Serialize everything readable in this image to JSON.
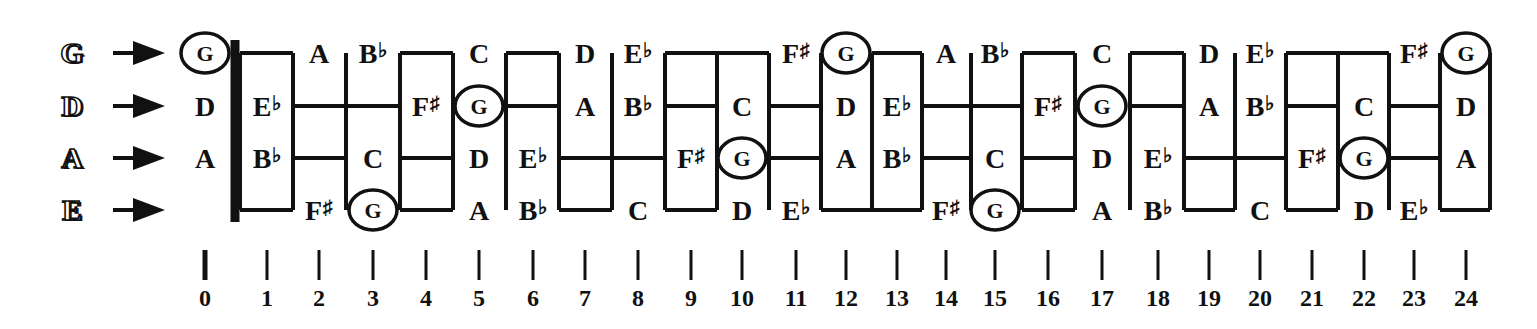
{
  "strings": [
    {
      "name": "G",
      "y": 53
    },
    {
      "name": "D",
      "y": 106
    },
    {
      "name": "A",
      "y": 158
    },
    {
      "name": "E",
      "y": 210
    }
  ],
  "arrow_icon": "right-arrow-icon",
  "fret_x": [
    205,
    267,
    319,
    373,
    426,
    479,
    533,
    585,
    638,
    691,
    742,
    796,
    846,
    897,
    946,
    995,
    1048,
    1102,
    1158,
    1209,
    1260,
    1312,
    1364,
    1414,
    1466
  ],
  "fret_numbers": [
    "0",
    "1",
    "2",
    "3",
    "4",
    "5",
    "6",
    "7",
    "8",
    "9",
    "10",
    "11",
    "12",
    "13",
    "14",
    "15",
    "16",
    "17",
    "18",
    "19",
    "20",
    "21",
    "22",
    "23",
    "24"
  ],
  "notes": {
    "G": [
      "G",
      "",
      "A",
      "B♭",
      "",
      "C",
      "",
      "D",
      "E♭",
      "",
      "",
      "F♯",
      "G",
      "",
      "A",
      "B♭",
      "",
      "C",
      "",
      "D",
      "E♭",
      "",
      "",
      "F♯",
      "G"
    ],
    "D": [
      "D",
      "E♭",
      "",
      "",
      "F♯",
      "G",
      "",
      "A",
      "B♭",
      "",
      "C",
      "",
      "D",
      "E♭",
      "",
      "",
      "F♯",
      "G",
      "",
      "A",
      "B♭",
      "",
      "C",
      "",
      "D"
    ],
    "A": [
      "A",
      "B♭",
      "",
      "C",
      "",
      "D",
      "E♭",
      "",
      "",
      "F♯",
      "G",
      "",
      "A",
      "B♭",
      "",
      "C",
      "",
      "D",
      "E♭",
      "",
      "",
      "F♯",
      "G",
      "",
      "A"
    ],
    "E": [
      "",
      "",
      "F♯",
      "G",
      "",
      "A",
      "B♭",
      "",
      "C",
      "",
      "D",
      "E♭",
      "",
      "",
      "F♯",
      "G",
      "",
      "A",
      "B♭",
      "",
      "C",
      "",
      "D",
      "E♭",
      ""
    ]
  },
  "highlight_note": "G",
  "colors": {
    "ink": "#111111",
    "background": "#ffffff"
  }
}
